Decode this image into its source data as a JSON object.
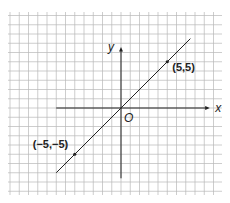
{
  "chart_data": {
    "type": "line",
    "title": "",
    "xlabel": "x",
    "ylabel": "y",
    "origin_label": "O",
    "grid": true,
    "xlim": [
      -11,
      11
    ],
    "ylim": [
      -9,
      10
    ],
    "series": [
      {
        "name": "y = x",
        "x": [
          -7,
          7.5
        ],
        "y": [
          -7,
          7.5
        ],
        "color": "#222222"
      }
    ],
    "points": [
      {
        "x": 5,
        "y": 5,
        "label": "(5,5)"
      },
      {
        "x": -5,
        "y": -5,
        "label": "(−5,−5)"
      }
    ]
  },
  "colors": {
    "grid": "#b8b8b8",
    "axis": "#222222",
    "paper": "#ffffff"
  }
}
